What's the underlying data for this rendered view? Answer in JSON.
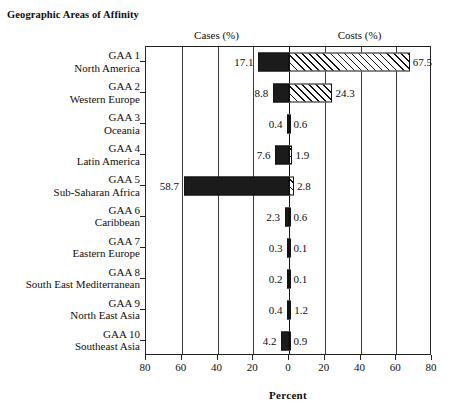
{
  "corner_title": "Geographic\nAreas of Affinity",
  "corner_title_line1": "Geographic",
  "corner_title_line2": "Areas of Affinity",
  "left_caption": "Cases (%)",
  "right_caption": "Costs (%)",
  "axis_title": "Percent",
  "colors": {
    "cases_fill": "#1b1b1b",
    "costs_fill": "#ffffff",
    "costs_hatch": "#111111",
    "frame": "#222222",
    "text": "#0d0d0d"
  },
  "chart_data": {
    "type": "bar",
    "title": "Geographic Areas of Affinity",
    "subtitle": "",
    "orientation": "horizontal-diverging",
    "xlabel": "Percent",
    "ylabel": "Geographic Areas of Affinity",
    "xlim": [
      -80,
      80
    ],
    "xticks": [
      -80,
      -60,
      -40,
      -20,
      0,
      20,
      40,
      60,
      80
    ],
    "xticklabels": [
      "80",
      "60",
      "40",
      "20",
      "0",
      "20",
      "40",
      "60",
      "80"
    ],
    "grid": true,
    "legend": [
      "Cases (%)",
      "Costs (%)"
    ],
    "legend_position": "top (column captions)",
    "categories": [
      "GAA 1 North America",
      "GAA 2 Western Europe",
      "GAA 3 Oceania",
      "GAA 4 Latin America",
      "GAA 5 Sub-Saharan Africa",
      "GAA 6 Caribbean",
      "GAA 7 Eastern Europe",
      "GAA 8 South East Mediterranean",
      "GAA 9 North East Asia",
      "GAA 10 Southeast Asia"
    ],
    "series": [
      {
        "name": "Cases (%)",
        "direction": "left",
        "values": [
          17.1,
          8.8,
          0.4,
          7.6,
          58.7,
          2.3,
          0.3,
          0.2,
          0.4,
          4.2
        ]
      },
      {
        "name": "Costs (%)",
        "direction": "right",
        "values": [
          67.5,
          24.3,
          0.6,
          1.9,
          2.8,
          0.6,
          0.1,
          0.1,
          1.2,
          0.9
        ]
      }
    ]
  },
  "rows": [
    {
      "code": "GAA 1",
      "name": "North America",
      "cases": "17.1",
      "costs": "67.5",
      "cases_v": 17.1,
      "costs_v": 67.5
    },
    {
      "code": "GAA 2",
      "name": "Western Europe",
      "cases": "8.8",
      "costs": "24.3",
      "cases_v": 8.8,
      "costs_v": 24.3
    },
    {
      "code": "GAA 3",
      "name": "Oceania",
      "cases": "0.4",
      "costs": "0.6",
      "cases_v": 0.4,
      "costs_v": 0.6
    },
    {
      "code": "GAA 4",
      "name": "Latin America",
      "cases": "7.6",
      "costs": "1.9",
      "cases_v": 7.6,
      "costs_v": 1.9
    },
    {
      "code": "GAA 5",
      "name": "Sub-Saharan Africa",
      "cases": "58.7",
      "costs": "2.8",
      "cases_v": 58.7,
      "costs_v": 2.8
    },
    {
      "code": "GAA 6",
      "name": "Caribbean",
      "cases": "2.3",
      "costs": "0.6",
      "cases_v": 2.3,
      "costs_v": 0.6
    },
    {
      "code": "GAA 7",
      "name": "Eastern Europe",
      "cases": "0.3",
      "costs": "0.1",
      "cases_v": 0.3,
      "costs_v": 0.1
    },
    {
      "code": "GAA 8",
      "name": "South East Mediterranean",
      "cases": "0.2",
      "costs": "0.1",
      "cases_v": 0.2,
      "costs_v": 0.1
    },
    {
      "code": "GAA 9",
      "name": "North East Asia",
      "cases": "0.4",
      "costs": "1.2",
      "cases_v": 0.4,
      "costs_v": 1.2
    },
    {
      "code": "GAA 10",
      "name": "Southeast Asia",
      "cases": "4.2",
      "costs": "0.9",
      "cases_v": 4.2,
      "costs_v": 0.9
    }
  ]
}
